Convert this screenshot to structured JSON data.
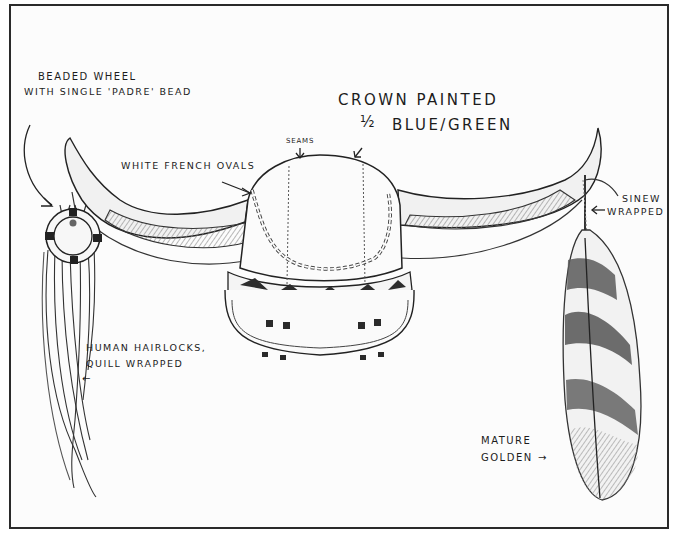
{
  "figure": {
    "style": "pencil sketch, black and white",
    "colors": {
      "ink": "#1c1c1c",
      "frame": "#2a2a2a",
      "paper": "#fcfcfc",
      "shade": "#9a9a9a"
    }
  },
  "annotations": {
    "beaded_wheel": {
      "line1": "Beaded wheel",
      "line2": "with single 'Padre' bead"
    },
    "crown": {
      "line1": "Crown painted",
      "fraction": "½",
      "line2": "Blue/Green"
    },
    "seams": "Seams",
    "white_french_ovals": "White French ovals",
    "sinew": {
      "line1": "Sinew",
      "line2": "wrapped"
    },
    "hairlocks": {
      "line1": "Human hairlocks,",
      "line2": "quill wrapped",
      "arrow": "←"
    },
    "feather": {
      "line1": "Mature",
      "line2": "golden",
      "arrow": "→"
    }
  }
}
